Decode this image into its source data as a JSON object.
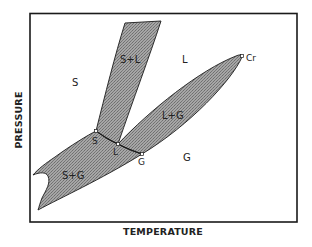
{
  "diagram": {
    "type": "phase-diagram",
    "x_axis_label": "TEMPERATURE",
    "y_axis_label": "PRESSURE",
    "regions": {
      "solid": "S",
      "liquid": "L",
      "gas": "G",
      "solid_liquid": "S+L",
      "liquid_gas": "L+G",
      "solid_gas": "S+G"
    },
    "points": {
      "solid_point": "S",
      "liquid_point": "L",
      "gas_point": "G",
      "critical_point": "Cr"
    },
    "colors": {
      "frame": "#1a1a1a",
      "two_phase_fill": "#9a9a9a",
      "boundary": "#1a1a1a",
      "background": "#ffffff"
    }
  }
}
